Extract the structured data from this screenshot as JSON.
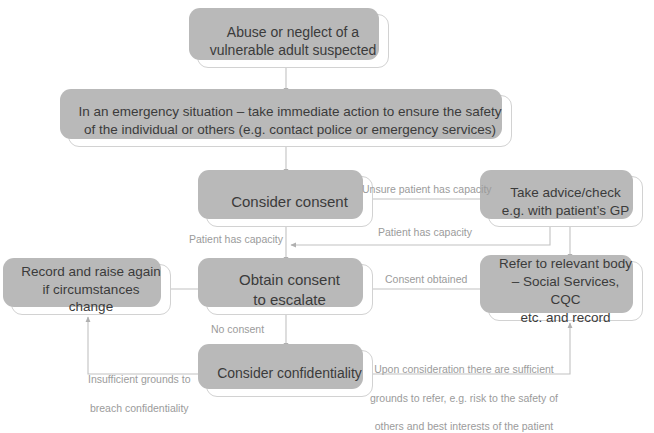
{
  "diagram": {
    "colors": {
      "box_fill": "#ffffff",
      "box_border": "#d2d2d2",
      "box_shadow": "#b9b9b9",
      "text": "#3b3b3b",
      "label_text": "#9b9b9b",
      "connector": "#b0b0b0"
    },
    "nodes": [
      {
        "id": "abuse",
        "lines": [
          "Abuse or neglect of a",
          "vulnerable adult suspected"
        ]
      },
      {
        "id": "emergency",
        "lines": [
          "In an emergency situation – take immediate action to ensure the safety",
          "of the individual or others (e.g. contact police or emergency services)"
        ]
      },
      {
        "id": "consent",
        "lines": [
          "Consider consent"
        ]
      },
      {
        "id": "advice",
        "lines": [
          "Take advice/check",
          "e.g. with patient’s GP"
        ]
      },
      {
        "id": "record",
        "lines": [
          "Record and raise again",
          "if circumstances change"
        ]
      },
      {
        "id": "obtain",
        "lines": [
          "Obtain consent",
          "to escalate"
        ]
      },
      {
        "id": "refer",
        "lines": [
          "Refer to relevant body",
          "– Social Services, CQC",
          "etc. and record"
        ]
      },
      {
        "id": "confidentiality",
        "lines": [
          "Consider confidentiality"
        ]
      }
    ],
    "edge_labels": [
      {
        "id": "unsure",
        "text": "Unsure patient has capacity"
      },
      {
        "id": "capacity_left",
        "text": "Patient has capacity"
      },
      {
        "id": "capacity_right",
        "text": "Patient has capacity"
      },
      {
        "id": "consent_obtained",
        "text": "Consent obtained"
      },
      {
        "id": "no_consent",
        "text": "No consent"
      },
      {
        "id": "insufficient",
        "text": "Insufficient grounds to\nbreach confidentiality"
      },
      {
        "id": "upon_consideration",
        "text": "Upon consideration there are sufficient\ngrounds to refer, e.g. risk to the safety of\nothers and best interests of the patient"
      }
    ]
  },
  "nodes": {
    "abuse": {
      "line1": "Abuse or neglect of a",
      "line2": "vulnerable adult suspected"
    },
    "emergency": {
      "line1": "In an emergency situation – take immediate action to ensure the safety",
      "line2": "of the individual or others (e.g. contact police or emergency services)"
    },
    "consent": {
      "line1": "Consider consent"
    },
    "advice": {
      "line1": "Take advice/check",
      "line2": "e.g. with patient’s GP"
    },
    "record": {
      "line1": "Record and raise again",
      "line2": "if circumstances change"
    },
    "obtain": {
      "line1": "Obtain consent",
      "line2": "to escalate"
    },
    "refer": {
      "line1": "Refer to relevant body",
      "line2": "– Social Services, CQC",
      "line3": "etc. and record"
    },
    "confidentiality": {
      "line1": "Consider confidentiality"
    }
  },
  "labels": {
    "unsure": "Unsure patient has capacity",
    "capacity_left": "Patient has capacity",
    "capacity_right": "Patient has capacity",
    "consent_obtained": "Consent obtained",
    "no_consent": "No consent",
    "insufficient_l1": "Insufficient grounds to",
    "insufficient_l2": "breach confidentiality",
    "upon_l1": "Upon consideration there are sufficient",
    "upon_l2": "grounds to refer, e.g. risk to the safety of",
    "upon_l3": "others and best interests of the patient"
  }
}
